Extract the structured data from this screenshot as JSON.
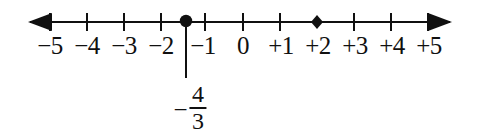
{
  "figure": {
    "type": "number-line-diagram",
    "background_color": "#ffffff",
    "ink_color": "#101010",
    "axis": {
      "name": "horizontal-number-line",
      "y": 22,
      "start_x": 28,
      "end_x": 452,
      "left_arrow": "left-arrowhead",
      "right_arrow": "right-arrowhead",
      "stroke_width": 2.6,
      "unit_px": 37,
      "origin_x": 243
    },
    "ticks": [
      {
        "label": "−5",
        "value": -5,
        "x": 50,
        "has_tick": true
      },
      {
        "label": "−4",
        "value": -4,
        "x": 87,
        "has_tick": true
      },
      {
        "label": "−3",
        "value": -3,
        "x": 124,
        "has_tick": true
      },
      {
        "label": "−2",
        "value": -2,
        "x": 161,
        "has_tick": true
      },
      {
        "label": "−1",
        "value": -1,
        "x": 205,
        "has_tick": true
      },
      {
        "label": "0",
        "value": 0,
        "x": 243,
        "has_tick": true
      },
      {
        "label": "+1",
        "value": 1,
        "x": 280,
        "has_tick": true
      },
      {
        "label": "+2",
        "value": 2,
        "x": 317,
        "has_tick": false
      },
      {
        "label": "+3",
        "value": 3,
        "x": 354,
        "has_tick": true
      },
      {
        "label": "+4",
        "value": 4,
        "x": 391,
        "has_tick": true
      },
      {
        "label": "+5",
        "value": 5,
        "x": 428,
        "has_tick": true
      }
    ],
    "label_y": 33,
    "markers": [
      {
        "name": "plotted-point-negative-four-thirds",
        "shape": "filled-circle",
        "value": -1.3333,
        "x": 186,
        "radius": 6.2,
        "has_drop_line": true,
        "drop_line_bottom_y": 78
      },
      {
        "name": "plotted-point-positive-two",
        "shape": "filled-diamond",
        "value": 2,
        "x": 317,
        "radius": 6.0,
        "has_drop_line": false
      }
    ],
    "point_label": {
      "name": "fraction-label-negative-four-thirds",
      "sign": "−",
      "numerator": "4",
      "denominator": "3",
      "x": 190,
      "y": 82,
      "reads_as": "−4/3"
    }
  }
}
